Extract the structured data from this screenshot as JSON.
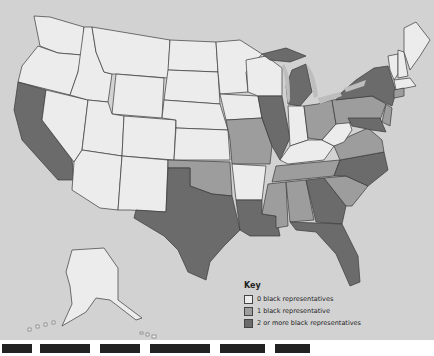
{
  "map": {
    "subject": "Black representatives in U.S. House by state",
    "colors": {
      "background": "#d2d2d2",
      "zero": "#ececec",
      "one": "#9d9d9d",
      "two_plus": "#6b6b6b",
      "border": "#3a3a3a"
    },
    "states_two_plus": [
      "California",
      "Texas",
      "Louisiana",
      "Illinois",
      "Michigan",
      "New York",
      "Georgia",
      "Florida",
      "North Carolina",
      "Maryland"
    ],
    "states_one": [
      "Missouri",
      "Oklahoma",
      "Tennessee",
      "Mississippi",
      "Alabama",
      "South Carolina",
      "Ohio",
      "Pennsylvania",
      "Virginia",
      "New Jersey",
      "Connecticut",
      "Wisconsin"
    ]
  },
  "key": {
    "title": "Key",
    "items": [
      {
        "label": "0 black representatives",
        "color": "#ececec"
      },
      {
        "label": "1 black representative",
        "color": "#9d9d9d"
      },
      {
        "label": "2 or more black representatives",
        "color": "#6b6b6b"
      }
    ]
  }
}
